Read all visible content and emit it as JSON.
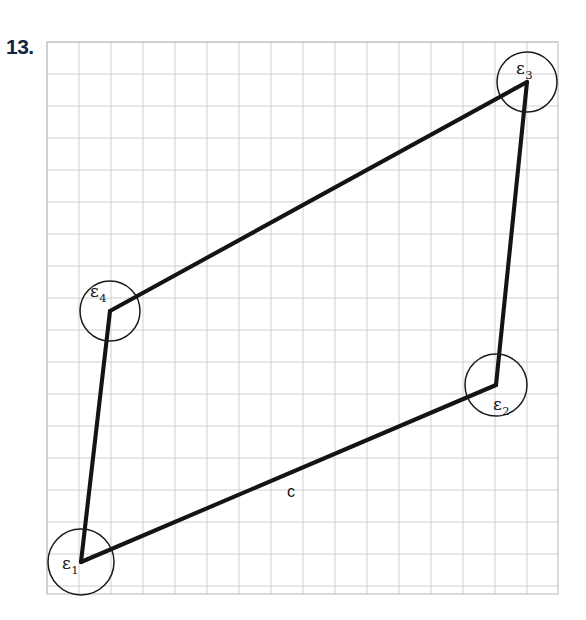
{
  "problem": {
    "number": "13."
  },
  "figure": {
    "type": "quadrilateral-angle-diagram",
    "grid": {
      "x0": 47,
      "y0": 42,
      "x1": 558,
      "y1": 594,
      "cell": 32,
      "color": "#c9c9cf",
      "border_color": "#bdbdc4"
    },
    "stroke_color": "#141414",
    "vertices": [
      {
        "id": "e1",
        "label": "ε",
        "subscript": "1",
        "x": 81,
        "y": 562,
        "label_x": 62,
        "label_y": 569,
        "arc_r": 33
      },
      {
        "id": "e2",
        "label": "ε",
        "subscript": "2",
        "x": 496,
        "y": 385,
        "label_x": 493,
        "label_y": 410,
        "arc_r": 31
      },
      {
        "id": "e3",
        "label": "ε",
        "subscript": "3",
        "x": 527,
        "y": 82,
        "label_x": 516,
        "label_y": 74,
        "arc_r": 30
      },
      {
        "id": "e4",
        "label": "ε",
        "subscript": "4",
        "x": 110,
        "y": 311,
        "label_x": 90,
        "label_y": 297,
        "arc_r": 30
      }
    ],
    "edges": [
      {
        "from": "e1",
        "to": "e4"
      },
      {
        "from": "e4",
        "to": "e3"
      },
      {
        "from": "e3",
        "to": "e2"
      },
      {
        "from": "e2",
        "to": "e1"
      }
    ],
    "side_labels": [
      {
        "id": "c",
        "text": "c",
        "x": 291,
        "y": 497
      }
    ]
  }
}
